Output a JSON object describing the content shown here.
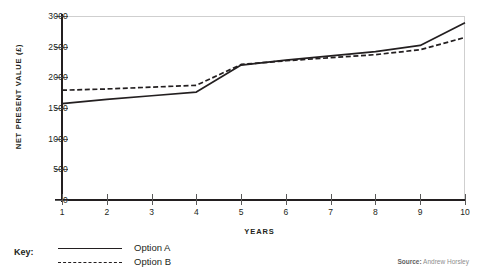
{
  "chart_data": {
    "type": "line",
    "title": "",
    "xlabel": "YEARS",
    "ylabel": "NET PRESENT VALUE (£)",
    "x": [
      1,
      2,
      3,
      4,
      5,
      6,
      7,
      8,
      9,
      10
    ],
    "xlim": [
      1,
      10
    ],
    "ylim": [
      0,
      3000
    ],
    "ytick_labels": [
      "0",
      "500",
      "1000",
      "1500",
      "2000",
      "2500",
      "3000"
    ],
    "ytick_values": [
      0,
      500,
      1000,
      1500,
      2000,
      2500,
      3000
    ],
    "xtick_labels": [
      "1",
      "2",
      "3",
      "4",
      "5",
      "6",
      "7",
      "8",
      "9",
      "10"
    ],
    "grid": false,
    "legend_position": "below-left",
    "series": [
      {
        "name": "Option A",
        "style": "solid",
        "color": "#231f20",
        "values": [
          1570,
          1640,
          1700,
          1760,
          2200,
          2280,
          2350,
          2420,
          2520,
          2890
        ]
      },
      {
        "name": "Option B",
        "style": "dashed",
        "color": "#231f20",
        "values": [
          1790,
          1810,
          1840,
          1870,
          2210,
          2270,
          2320,
          2370,
          2450,
          2650
        ]
      }
    ]
  },
  "axes": {
    "y_title": "NET PRESENT VALUE (£)",
    "x_title": "YEARS"
  },
  "legend": {
    "key_label": "Key:",
    "entries": [
      {
        "label": "Option A",
        "style": "solid"
      },
      {
        "label": "Option B",
        "style": "dashed"
      }
    ]
  },
  "source": {
    "label": "Source:",
    "value": "Andrew Horsley"
  },
  "colors": {
    "ink": "#231f20",
    "border": "#cfcfcf",
    "source_label": "#5f5f5f",
    "source_value": "#8d8d8d",
    "background": "#ffffff"
  }
}
